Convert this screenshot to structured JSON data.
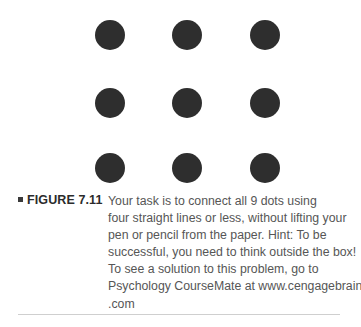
{
  "figure": {
    "label_bullet": "square-bullet",
    "label": "FIGURE 7.11",
    "caption_lines": [
      "Your task is to connect all 9 dots using",
      "four straight lines or less, without lifting your",
      "pen or pencil from the paper. Hint: To be",
      "successful, you need to think outside the box!",
      "To see a solution to this problem, go to",
      "Psychology CourseMate at www.cengagebrain",
      ".com"
    ],
    "caption_text": "Your task is to connect all 9 dots using four straight lines or less, without lifting your pen or pencil from the paper. Hint: To be successful, you need to think outside the box! To see a solution to this problem, go to Psychology CourseMate at www.cengagebrain.com"
  },
  "diagram": {
    "name": "nine-dot-puzzle",
    "rows": 3,
    "columns": 3,
    "dot_count": 9,
    "dot_color": "#2e2e2e",
    "background_color": "#ffffff"
  },
  "colors": {
    "dot": "#2e2e2e",
    "label_text": "#2b2b2b",
    "body_text": "#565656",
    "rule": "#cfcfcf",
    "background": "#ffffff"
  }
}
